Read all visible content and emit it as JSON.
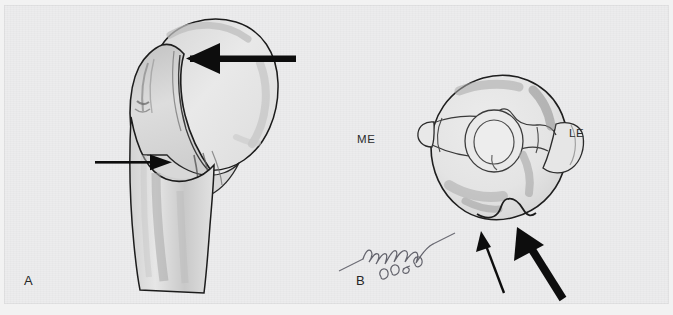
{
  "figure": {
    "type": "medical-illustration",
    "background_color": "#ececed",
    "ink_color": "#1a1a1a",
    "shading_color": "#b9b9b9",
    "panels": [
      {
        "id": "A",
        "label": "A",
        "view": "proximal humerus, lateral view",
        "annotations": [
          {
            "name": "thick-arrow",
            "style": "thick",
            "direction": "left",
            "target": "greater tuberosity / bicipital groove"
          },
          {
            "name": "thin-arrow",
            "style": "thin",
            "direction": "right",
            "target": "humeral shaft metaphysis"
          }
        ]
      },
      {
        "id": "B",
        "label": "B",
        "view": "distal humerus, axial view",
        "side_labels": [
          {
            "name": "medial-epicondyle",
            "text": "ME"
          },
          {
            "name": "lateral-epicondyle",
            "text": "LE"
          }
        ],
        "annotations": [
          {
            "name": "thin-arrow",
            "style": "thin",
            "direction": "up-left",
            "target": "trochlear notch margin"
          },
          {
            "name": "thick-arrow",
            "style": "thick",
            "direction": "up-left",
            "target": "olecranon fossa rim"
          }
        ],
        "signature": {
          "name": "artist-signature",
          "text": "McFarland",
          "year": "2006"
        }
      }
    ]
  }
}
